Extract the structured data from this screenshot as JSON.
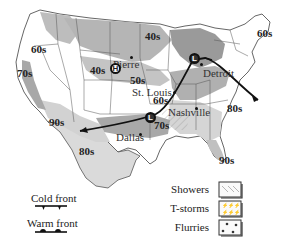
{
  "map": {
    "type": "weather-map",
    "region": "United States",
    "colors": {
      "land": "#ffffff",
      "shade_light": "#d9d9d9",
      "shade_dark": "#a9a9a9",
      "border": "#555555",
      "front": "#111111"
    },
    "temperature_bands": [
      {
        "label": "60s",
        "x": 20,
        "y": 67
      },
      {
        "label": "70s",
        "x": 6,
        "y": 96
      },
      {
        "label": "40s",
        "x": 92,
        "y": 68
      },
      {
        "label": "50s",
        "x": 129,
        "y": 75
      },
      {
        "label": "40s",
        "x": 146,
        "y": 31
      },
      {
        "label": "60s",
        "x": 257,
        "y": 28
      },
      {
        "label": "60s",
        "x": 153,
        "y": 98
      },
      {
        "label": "90s",
        "x": 49,
        "y": 121
      },
      {
        "label": "80s",
        "x": 79,
        "y": 147
      },
      {
        "label": "70s",
        "x": 154,
        "y": 124
      },
      {
        "label": "80s",
        "x": 227,
        "y": 103
      },
      {
        "label": "90s",
        "x": 220,
        "y": 154
      }
    ],
    "cities": [
      {
        "name": "Pierre",
        "dot_x": 131,
        "dot_y": 58,
        "label_x": 113,
        "label_y": 60
      },
      {
        "name": "St. Louis",
        "dot_x": 174,
        "dot_y": 91,
        "label_x": 133,
        "label_y": 89
      },
      {
        "name": "Detroit",
        "dot_x": 196,
        "dot_y": 65,
        "label_x": 203,
        "label_y": 69
      },
      {
        "name": "Nashville",
        "dot_x": 196,
        "dot_y": 107,
        "label_x": 168,
        "label_y": 108
      },
      {
        "name": "Dallas",
        "dot_x": 139,
        "dot_y": 133,
        "label_x": 117,
        "label_y": 133
      }
    ],
    "pressure_systems": [
      {
        "type": "H",
        "x": 113,
        "y": 66
      },
      {
        "type": "L",
        "x": 193,
        "y": 56
      },
      {
        "type": "L",
        "x": 149,
        "y": 115
      }
    ]
  },
  "legend": {
    "fronts": [
      {
        "label": "Cold front",
        "type": "cold"
      },
      {
        "label": "Warm front",
        "type": "warm"
      }
    ],
    "precipitation": [
      {
        "label": "Showers",
        "pattern": "diagonal-hatch"
      },
      {
        "label": "T-storms",
        "pattern": "storm-marks"
      },
      {
        "label": "Flurries",
        "pattern": "snow-dots"
      }
    ]
  }
}
